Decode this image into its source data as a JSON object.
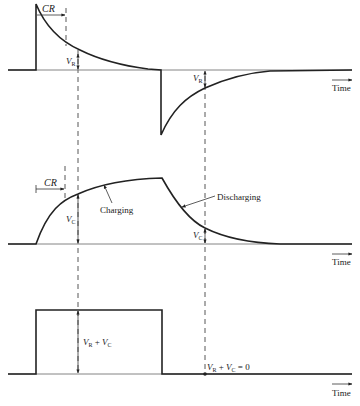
{
  "figure": {
    "panels": [
      {
        "id": "resistor-voltage",
        "labels": {
          "cr": "CR",
          "vr_1": "V",
          "vr_1_sub": "R",
          "vr_2": "V",
          "vr_2_sub": "R",
          "time": "Time"
        }
      },
      {
        "id": "capacitor-voltage",
        "labels": {
          "cr": "CR",
          "vc_1": "V",
          "vc_1_sub": "C",
          "vc_2": "V",
          "vc_2_sub": "C",
          "charging": "Charging",
          "discharging": "Discharging",
          "time": "Time"
        }
      },
      {
        "id": "sum-voltage",
        "labels": {
          "sum_v1": "V",
          "sum_v1_sub": "R",
          "sum_plus": " + ",
          "sum_v2": "V",
          "sum_v2_sub": "C",
          "zero_v1": "V",
          "zero_v1_sub": "R",
          "zero_plus": " + ",
          "zero_v2": "V",
          "zero_v2_sub": "C",
          "zero_eq": " = 0",
          "time": "Time"
        }
      }
    ],
    "colors": {
      "ink": "#222222",
      "baseline": "#777777",
      "background": "#ffffff"
    }
  }
}
